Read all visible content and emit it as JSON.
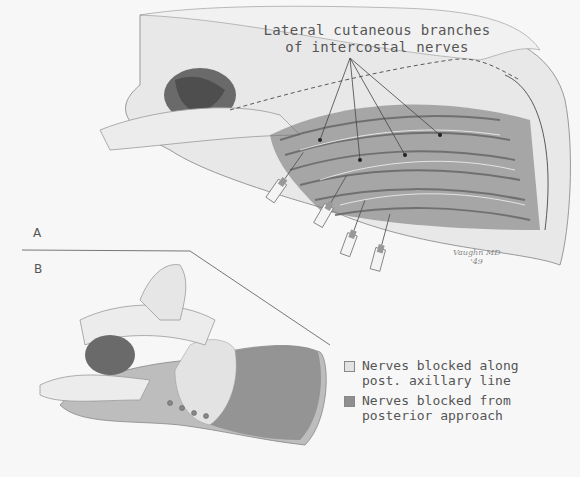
{
  "figure": {
    "panel_a": {
      "label": "A",
      "annotation": "Lateral cutaneous branches\nof intercostal nerves",
      "signature": "Vaughn MD\n'49"
    },
    "panel_b": {
      "label": "B"
    },
    "legend": [
      {
        "text": "Nerves blocked along\npost. axillary line",
        "color": "#e3e3e3"
      },
      {
        "text": "Nerves blocked from\nposterior approach",
        "color": "#8f8f8f"
      }
    ]
  }
}
